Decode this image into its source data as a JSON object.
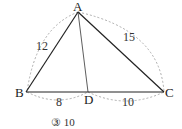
{
  "diagram": {
    "type": "triangle",
    "points": {
      "A": "A",
      "B": "B",
      "C": "C",
      "D": "D"
    },
    "segments": [
      {
        "from": "A",
        "to": "B",
        "label": "12"
      },
      {
        "from": "A",
        "to": "C",
        "label": "15"
      },
      {
        "from": "B",
        "to": "D",
        "label": "8"
      },
      {
        "from": "D",
        "to": "C",
        "label": "10"
      },
      {
        "from": "A",
        "to": "D",
        "label": ""
      }
    ]
  },
  "caption": "③ 10"
}
